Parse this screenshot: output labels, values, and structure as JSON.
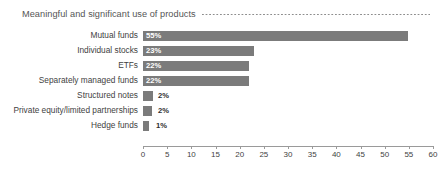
{
  "chart_data": {
    "type": "bar",
    "orientation": "horizontal",
    "title": "Meaningful and significant use of products",
    "xlabel": "",
    "ylabel": "",
    "xlim": [
      0,
      60
    ],
    "xticks": [
      0,
      5,
      10,
      15,
      20,
      25,
      30,
      35,
      40,
      45,
      50,
      55,
      60
    ],
    "xtick_labels": [
      "0",
      "5",
      "10",
      "15",
      "20",
      "25",
      "30",
      "35",
      "40",
      "45",
      "50",
      "55",
      "60"
    ],
    "grid": false,
    "legend": null,
    "categories": [
      "Mutual funds",
      "Individual stocks",
      "ETFs",
      "Separately managed funds",
      "Structured notes",
      "Private equity/limited partnerships",
      "Hedge funds"
    ],
    "values": [
      55,
      23,
      22,
      22,
      2,
      2,
      1
    ],
    "data_labels": [
      "55%",
      "23%",
      "22%",
      "22%",
      "2%",
      "2%",
      "1%"
    ],
    "bar_color": "#7b7b7b",
    "inside_label_color": "#ffffff",
    "outside_label_color": "#2f2f2f",
    "axis_color": "#9a9a9a",
    "title_color": "#555555",
    "background": "#ffffff"
  }
}
